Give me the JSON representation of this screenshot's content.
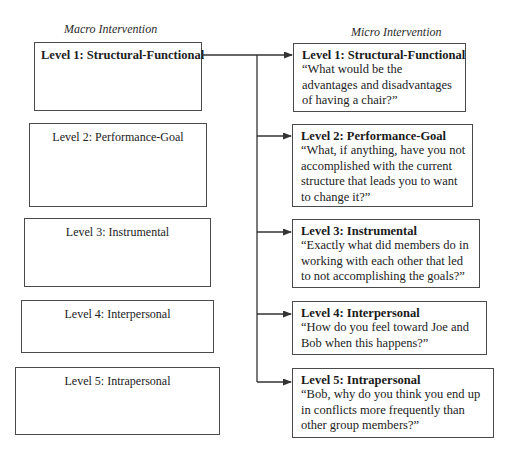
{
  "diagram": {
    "macro_title": "Macro Intervention",
    "micro_title": "Micro Intervention",
    "macro_levels": [
      {
        "label": "Level 1: Structural-Functional",
        "emphasized": true
      },
      {
        "label": "Level 2: Performance-Goal",
        "emphasized": false
      },
      {
        "label": "Level 3: Instrumental",
        "emphasized": false
      },
      {
        "label": "Level 4: Interpersonal",
        "emphasized": false
      },
      {
        "label": "Level 5: Intrapersonal",
        "emphasized": false
      }
    ],
    "micro_levels": [
      {
        "label": "Level 1: Structural-Functional",
        "quote": "“What would be the advantages and disadvantages of having a chair?”"
      },
      {
        "label": "Level 2: Performance-Goal",
        "quote": "“What, if anything, have you not accomplished with the current structure that leads you to want to change it?”"
      },
      {
        "label": "Level 3: Instrumental",
        "quote": "“Exactly what did members do in working with each other that led to not accomplishing the goals?”"
      },
      {
        "label": "Level 4: Interpersonal",
        "quote": "“How do you feel toward Joe and Bob when this happens?”"
      },
      {
        "label": "Level 5: Intrapersonal",
        "quote": "“Bob, why do you think you end up in conflicts more frequently than other group members?”"
      }
    ],
    "connector": {
      "from": "Macro Level 1: Structural-Functional",
      "to": [
        "Micro Level 1",
        "Micro Level 2",
        "Micro Level 3",
        "Micro Level 4",
        "Micro Level 5"
      ],
      "color": "#333333"
    }
  }
}
